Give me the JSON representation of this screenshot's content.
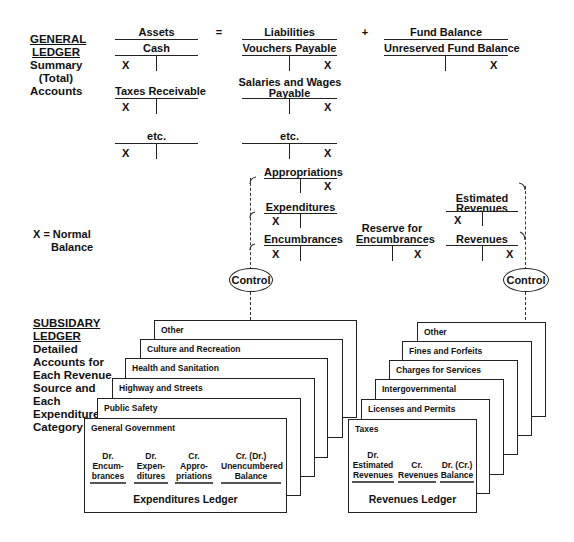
{
  "general_ledger": {
    "title": [
      "GENERAL",
      "LEDGER"
    ],
    "subtitle": [
      "Summary",
      "(Total)",
      "Accounts"
    ],
    "equation": {
      "assets": "Assets",
      "equals": "=",
      "liabilities": "Liabilities",
      "plus": "+",
      "fund_balance": "Fund Balance"
    },
    "accounts": {
      "cash": "Cash",
      "taxes_receivable": "Taxes Receivable",
      "assets_etc": "etc.",
      "vouchers_payable": "Vouchers Payable",
      "salaries_wages": [
        "Salaries and Wages",
        "Payable"
      ],
      "liab_etc": "etc.",
      "unreserved_fund_balance": "Unreserved Fund Balance",
      "appropriations": "Appropriations",
      "expenditures": "Expenditures",
      "encumbrances": "Encumbrances",
      "reserve_for_encumbrances": [
        "Reserve for",
        "Encumbrances"
      ],
      "estimated_revenues": [
        "Estimated",
        "Revenues"
      ],
      "revenues": "Revenues"
    },
    "x_mark": "X"
  },
  "legend": {
    "line1": "X = Normal",
    "line2": "Balance"
  },
  "control": {
    "left": "Control",
    "right": "Control"
  },
  "subsidiary_ledger": {
    "title": [
      "SUBSIDARY",
      "LEDGER"
    ],
    "description": [
      "Detailed",
      "Accounts for",
      "Each Revenue",
      "Source and",
      "Each",
      "Expenditure",
      "Category"
    ]
  },
  "expenditures_ledger": {
    "cards": [
      "Other",
      "Culture and Recreation",
      "Health and Sanitation",
      "Highway and Streets",
      "Public Safety",
      "General Government"
    ],
    "columns": [
      [
        "Dr.",
        "Encum-",
        "brances"
      ],
      [
        "Dr.",
        "Expen-",
        "ditures"
      ],
      [
        "Cr.",
        "Appro-",
        "priations"
      ],
      [
        "Cr. (Dr.)",
        "Unencumbered",
        "Balance"
      ]
    ],
    "title": "Expenditures Ledger"
  },
  "revenues_ledger": {
    "cards": [
      "Other",
      "Fines and Forfeits",
      "Charges for Services",
      "Intergovernmental",
      "Licenses and Permits",
      "Taxes"
    ],
    "columns": [
      [
        "Dr.",
        "Estimated",
        "Revenues"
      ],
      [
        "",
        "Cr.",
        "Revenues"
      ],
      [
        "",
        "Dr. (Cr.)",
        "Balance"
      ]
    ],
    "title": "Revenues Ledger"
  }
}
